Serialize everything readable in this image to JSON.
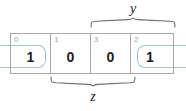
{
  "diagram": {
    "type": "karnaugh-map",
    "title": "",
    "cells": [
      {
        "index": "0",
        "value": "1",
        "grouped": true
      },
      {
        "index": "1",
        "value": "0",
        "grouped": false
      },
      {
        "index": "3",
        "value": "0",
        "grouped": false
      },
      {
        "index": "2",
        "value": "1",
        "grouped": true
      }
    ],
    "variables": [
      {
        "name": "y",
        "position": "top",
        "spans": [
          "3",
          "2"
        ]
      },
      {
        "name": "z",
        "position": "bottom",
        "spans": [
          "1",
          "3"
        ]
      }
    ],
    "groups": [
      {
        "name": "wrap-around-group",
        "cells": [
          "0",
          "2"
        ],
        "color": "#9cc3e0"
      }
    ],
    "colors": {
      "grid_line": "#a8a8a8",
      "index_text": "#8aa9c8",
      "value_text": "#1b1b1b",
      "group_outline": "#9cc3e0",
      "brace": "#6d6d6d",
      "background": "#ffffff"
    }
  }
}
